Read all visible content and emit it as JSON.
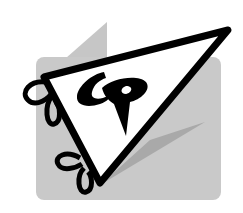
{
  "logo": {
    "monogram": "CP",
    "shape": "pennant-flag",
    "colors": {
      "background": "#ffffff",
      "panel": "#c8c8c8",
      "shadow": "#a8a8a8",
      "outline": "#000000",
      "fill": "#ffffff"
    }
  }
}
